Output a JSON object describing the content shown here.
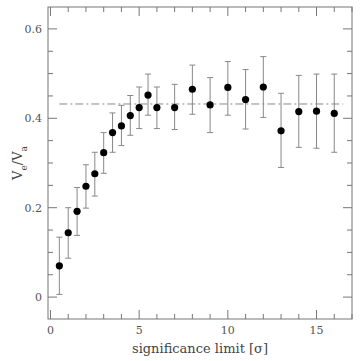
{
  "chart_data": {
    "type": "scatter",
    "title": "",
    "xlabel": "significance limit [σ]",
    "ylabel": "V_e/V_a",
    "xlim": [
      -0.14,
      17.0
    ],
    "ylim": [
      -0.049,
      0.649
    ],
    "grid": false,
    "legend": null,
    "x_ticks": [
      0,
      5,
      10,
      15
    ],
    "x_tick_labels": [
      "0",
      "5",
      "10",
      "15"
    ],
    "x_minor_step": 1,
    "y_ticks": [
      0,
      0.2,
      0.4,
      0.6
    ],
    "y_tick_labels": [
      "0",
      "0.2",
      "0.4",
      "0.6"
    ],
    "y_minor_step": 0.05,
    "series": [
      {
        "name": "V_e/V_a",
        "marker": "filled-circle",
        "color": "#000000",
        "x": [
          0.5,
          1.0,
          1.5,
          2.0,
          2.5,
          3.0,
          3.5,
          4.0,
          4.5,
          5.0,
          5.5,
          6.0,
          7.0,
          8.0,
          9.0,
          10.0,
          11.0,
          12.0,
          13.0,
          14.0,
          15.0,
          16.0
        ],
        "y": [
          0.07,
          0.144,
          0.192,
          0.248,
          0.276,
          0.323,
          0.368,
          0.383,
          0.406,
          0.424,
          0.452,
          0.424,
          0.424,
          0.465,
          0.43,
          0.469,
          0.442,
          0.47,
          0.372,
          0.415,
          0.416,
          0.411
        ],
        "y_err_high": [
          0.134,
          0.2,
          0.245,
          0.296,
          0.324,
          0.368,
          0.412,
          0.429,
          0.451,
          0.47,
          0.499,
          0.47,
          0.476,
          0.519,
          0.491,
          0.527,
          0.509,
          0.538,
          0.456,
          0.496,
          0.499,
          0.499
        ],
        "y_err_low": [
          0.006,
          0.087,
          0.138,
          0.199,
          0.226,
          0.277,
          0.324,
          0.339,
          0.362,
          0.377,
          0.407,
          0.377,
          0.375,
          0.409,
          0.368,
          0.407,
          0.376,
          0.402,
          0.29,
          0.335,
          0.333,
          0.324
        ]
      }
    ],
    "annotations": [
      {
        "type": "hline",
        "style": "dash-dot",
        "y": 0.432,
        "x_start": 0.5,
        "x_end": 16.5,
        "color": "#888888"
      }
    ]
  },
  "labels": {
    "xlabel": "significance limit [σ]",
    "ylabel_main": "V",
    "ylabel_sub1": "e",
    "ylabel_slash": "/V",
    "ylabel_sub2": "a"
  }
}
